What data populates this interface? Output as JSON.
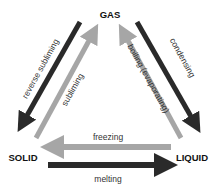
{
  "diagram": {
    "type": "phase-change-triangle",
    "states": {
      "gas": "GAS",
      "solid": "SOLID",
      "liquid": "LIQUID"
    },
    "transitions": {
      "reverse_subliming": {
        "label": "reverse subliming",
        "from": "GAS",
        "to": "SOLID",
        "color": "#2a2a2a"
      },
      "subliming": {
        "label": "subliming",
        "from": "SOLID",
        "to": "GAS",
        "color": "#a6a6a6"
      },
      "boiling": {
        "label": "boiling (evaporating)",
        "from": "LIQUID",
        "to": "GAS",
        "color": "#a6a6a6"
      },
      "condensing": {
        "label": "condensing",
        "from": "GAS",
        "to": "LIQUID",
        "color": "#2a2a2a"
      },
      "freezing": {
        "label": "freezing",
        "from": "LIQUID",
        "to": "SOLID",
        "color": "#a6a6a6"
      },
      "melting": {
        "label": "melting",
        "from": "SOLID",
        "to": "LIQUID",
        "color": "#2a2a2a"
      }
    },
    "colors": {
      "dark_arrow": "#2a2a2a",
      "light_arrow": "#a6a6a6",
      "text": "#111111"
    }
  }
}
